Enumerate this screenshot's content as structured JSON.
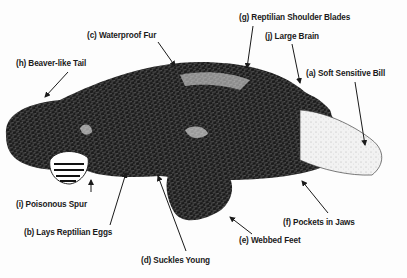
{
  "diagram": {
    "labels": [
      {
        "id": "g",
        "text": "(g) Reptilian Shoulder Blades",
        "x": 239,
        "y": 13
      },
      {
        "id": "c",
        "text": "(c) Waterproof Fur",
        "x": 87,
        "y": 31
      },
      {
        "id": "j",
        "text": "(j) Large Brain",
        "x": 265,
        "y": 32
      },
      {
        "id": "h",
        "text": "(h) Beaver-like Tail",
        "x": 16,
        "y": 59
      },
      {
        "id": "a",
        "text": "(a) Soft Sensitive Bill",
        "x": 306,
        "y": 69
      },
      {
        "id": "i",
        "text": "(i) Poisonous Spur",
        "x": 16,
        "y": 200
      },
      {
        "id": "f",
        "text": "(f) Pockets in Jaws",
        "x": 283,
        "y": 218
      },
      {
        "id": "b",
        "text": "(b) Lays Reptilian Eggs",
        "x": 24,
        "y": 228
      },
      {
        "id": "e",
        "text": "(e) Webbed Feet",
        "x": 239,
        "y": 236
      },
      {
        "id": "d",
        "text": "(d) Suckles Young",
        "x": 141,
        "y": 256
      }
    ],
    "arrows": [
      {
        "id": "g",
        "x1": 253,
        "y1": 26,
        "x2": 247,
        "y2": 68
      },
      {
        "id": "c",
        "x1": 158,
        "y1": 42,
        "x2": 175,
        "y2": 66
      },
      {
        "id": "j",
        "x1": 292,
        "y1": 44,
        "x2": 300,
        "y2": 83
      },
      {
        "id": "h",
        "x1": 68,
        "y1": 72,
        "x2": 45,
        "y2": 97
      },
      {
        "id": "a",
        "x1": 355,
        "y1": 82,
        "x2": 365,
        "y2": 145
      },
      {
        "id": "i",
        "x1": 91,
        "y1": 192,
        "x2": 91,
        "y2": 180
      },
      {
        "id": "f",
        "x1": 328,
        "y1": 213,
        "x2": 302,
        "y2": 181
      },
      {
        "id": "b",
        "x1": 110,
        "y1": 225,
        "x2": 126,
        "y2": 173
      },
      {
        "id": "e",
        "x1": 252,
        "y1": 234,
        "x2": 230,
        "y2": 217
      },
      {
        "id": "d",
        "x1": 186,
        "y1": 251,
        "x2": 158,
        "y2": 176
      }
    ]
  }
}
